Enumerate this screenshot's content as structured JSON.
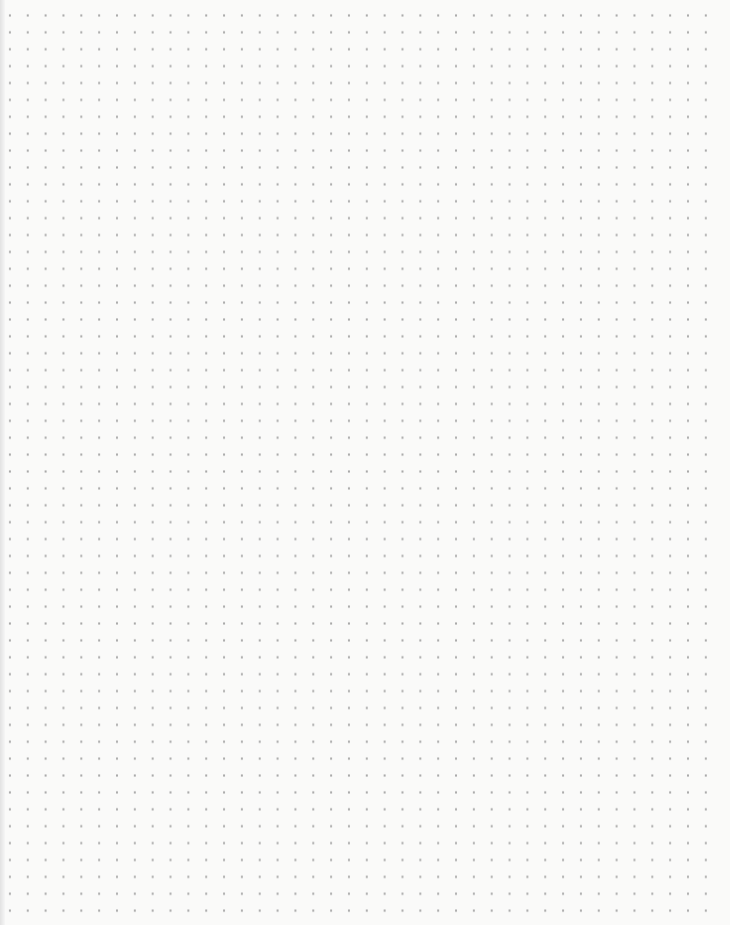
{
  "paper": {
    "type": "dot-grid",
    "background_color": "#fafaf9",
    "dot_color": "#a9a9a9",
    "columns": 40,
    "rows": 54,
    "spacing_x_px": 17.85,
    "spacing_y_px": 16.9
  }
}
